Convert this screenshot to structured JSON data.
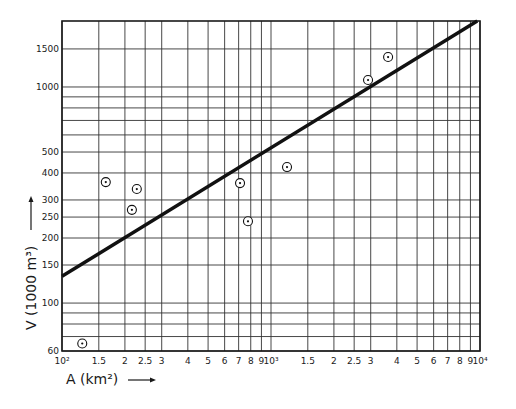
{
  "chart_data": {
    "type": "scatter",
    "title": "",
    "xlabel": "A (km²)",
    "ylabel": "V (1000 m³)",
    "xscale": "log",
    "yscale": "log",
    "xlim": [
      100,
      10000
    ],
    "ylim": [
      60,
      2020
    ],
    "grid": true,
    "legend": null,
    "x_tick_labels": [
      {
        "value": 100,
        "label": "10²"
      },
      {
        "value": 150,
        "label": "1.5"
      },
      {
        "value": 200,
        "label": "2"
      },
      {
        "value": 250,
        "label": "2.5"
      },
      {
        "value": 300,
        "label": "3"
      },
      {
        "value": 400,
        "label": "4"
      },
      {
        "value": 500,
        "label": "5"
      },
      {
        "value": 600,
        "label": "6"
      },
      {
        "value": 700,
        "label": "7"
      },
      {
        "value": 800,
        "label": "8"
      },
      {
        "value": 900,
        "label": "9"
      },
      {
        "value": 1000,
        "label": "10³"
      },
      {
        "value": 1500,
        "label": "1.5"
      },
      {
        "value": 2000,
        "label": "2"
      },
      {
        "value": 2500,
        "label": "2.5"
      },
      {
        "value": 3000,
        "label": "3"
      },
      {
        "value": 4000,
        "label": "4"
      },
      {
        "value": 5000,
        "label": "5"
      },
      {
        "value": 6000,
        "label": "6"
      },
      {
        "value": 7000,
        "label": "7"
      },
      {
        "value": 8000,
        "label": "8"
      },
      {
        "value": 9000,
        "label": "9"
      },
      {
        "value": 10000,
        "label": "10⁴"
      }
    ],
    "y_tick_labels": [
      {
        "value": 60,
        "label": "60"
      },
      {
        "value": 100,
        "label": "100"
      },
      {
        "value": 150,
        "label": "150"
      },
      {
        "value": 200,
        "label": "200"
      },
      {
        "value": 250,
        "label": "250"
      },
      {
        "value": 300,
        "label": "300"
      },
      {
        "value": 400,
        "label": "400"
      },
      {
        "value": 500,
        "label": "500"
      },
      {
        "value": 1000,
        "label": "1000"
      },
      {
        "value": 1500,
        "label": "1500"
      }
    ],
    "y_gridlines": [
      60,
      70,
      80,
      90,
      100,
      150,
      200,
      250,
      300,
      400,
      500,
      600,
      700,
      800,
      900,
      1000,
      1500
    ],
    "series": [
      {
        "name": "observations",
        "kind": "scatter",
        "marker": "circled-dot",
        "points": [
          {
            "x": 125,
            "y": 65
          },
          {
            "x": 162,
            "y": 363
          },
          {
            "x": 216,
            "y": 270
          },
          {
            "x": 228,
            "y": 337
          },
          {
            "x": 711,
            "y": 359
          },
          {
            "x": 776,
            "y": 239
          },
          {
            "x": 1193,
            "y": 426
          },
          {
            "x": 2913,
            "y": 1077
          },
          {
            "x": 3633,
            "y": 1376
          }
        ]
      },
      {
        "name": "fitted line",
        "kind": "line",
        "points": [
          {
            "x": 100,
            "y": 133
          },
          {
            "x": 9700,
            "y": 2020
          }
        ]
      }
    ]
  },
  "labels": {
    "x_axis": "A (km²)",
    "y_axis": "V (1000 m³)"
  }
}
